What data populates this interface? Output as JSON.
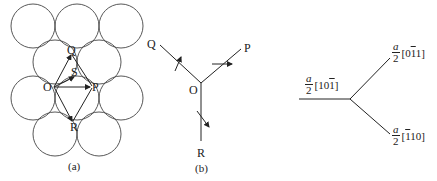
{
  "panel_a": {
    "caption": "(a)",
    "labels": {
      "O_left": "O",
      "Q": "Q",
      "S": "S",
      "P": "P",
      "R": "R"
    }
  },
  "panel_b": {
    "caption": "(b)",
    "labels": {
      "Q": "Q",
      "P": "P",
      "O": "O",
      "R": "R"
    }
  },
  "panel_c": {
    "left_vector": {
      "numerator": "a",
      "denominator": "2",
      "index": [
        "[1",
        "0",
        "1",
        "]"
      ],
      "bar_index": 2
    },
    "upper_vector": {
      "numerator": "a",
      "denominator": "2",
      "index": [
        "[0",
        "1",
        "1]"
      ],
      "bar_index": 1
    },
    "lower_vector": {
      "numerator": "a",
      "denominator": "2",
      "index": [
        "[",
        "1",
        "10]"
      ],
      "bar_index": 1
    }
  }
}
